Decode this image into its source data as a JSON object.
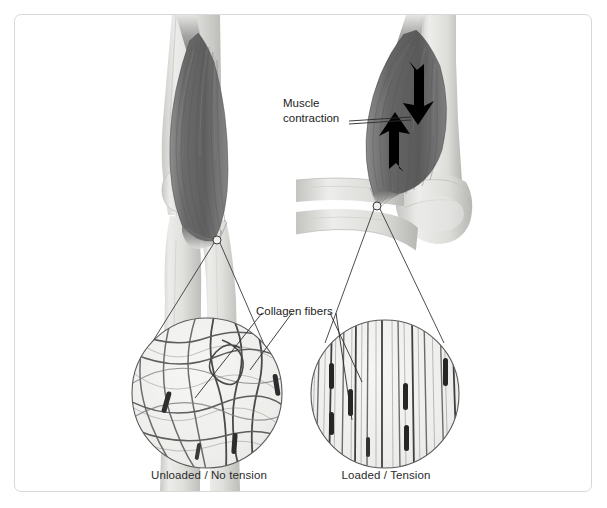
{
  "figure": {
    "background_color": "#ffffff",
    "border_color": "#d8d8d8",
    "ink_color": "#1d1d1d"
  },
  "labels": {
    "muscle_contraction_line1": "Muscle",
    "muscle_contraction_line2": "contraction",
    "collagen_fibers": "Collagen fibers"
  },
  "captions": {
    "left": "Unloaded / No tension",
    "right": "Loaded / Tension"
  },
  "panels": [
    {
      "id": "left-panel",
      "state": "unloaded",
      "caption": "Unloaded / No tension",
      "limb": "relaxed extended arm with biceps muscle at rest",
      "inset": {
        "center_x": 207,
        "center_y": 393,
        "radius": 76,
        "fiber_pattern": "wavy-crimped-crossing",
        "fiber_count": 14,
        "nuclei_count": 4
      }
    },
    {
      "id": "right-panel",
      "state": "loaded",
      "caption": "Loaded / Tension",
      "limb": "flexed arm with contracted biceps muscle and opposing contraction arrows",
      "inset": {
        "center_x": 385,
        "center_y": 394,
        "radius": 75,
        "fiber_pattern": "straight-parallel-aligned",
        "fiber_count": 22,
        "nuclei_count": 7
      }
    }
  ],
  "annotations": {
    "arrows": [
      {
        "name": "contraction-arrow-upper",
        "direction": "down-left"
      },
      {
        "name": "contraction-arrow-lower",
        "direction": "up-right"
      }
    ],
    "callout_markers": [
      {
        "name": "tendon-callout-left",
        "x": 217,
        "y": 240,
        "radius": 4
      },
      {
        "name": "tendon-callout-right",
        "x": 377,
        "y": 206,
        "radius": 4
      }
    ]
  },
  "palette": {
    "muscle_dark": "#6f6f6f",
    "muscle_mid": "#8d8d8d",
    "bone_light": "#e3e3e1",
    "bone_shadow": "#c2c2c0",
    "fiber_dark": "#4a4a4a",
    "fiber_mid": "#8a8a8a",
    "nucleus": "#2a2a2a",
    "inset_fill": "#f0f0ee",
    "arrow": "#000000"
  }
}
